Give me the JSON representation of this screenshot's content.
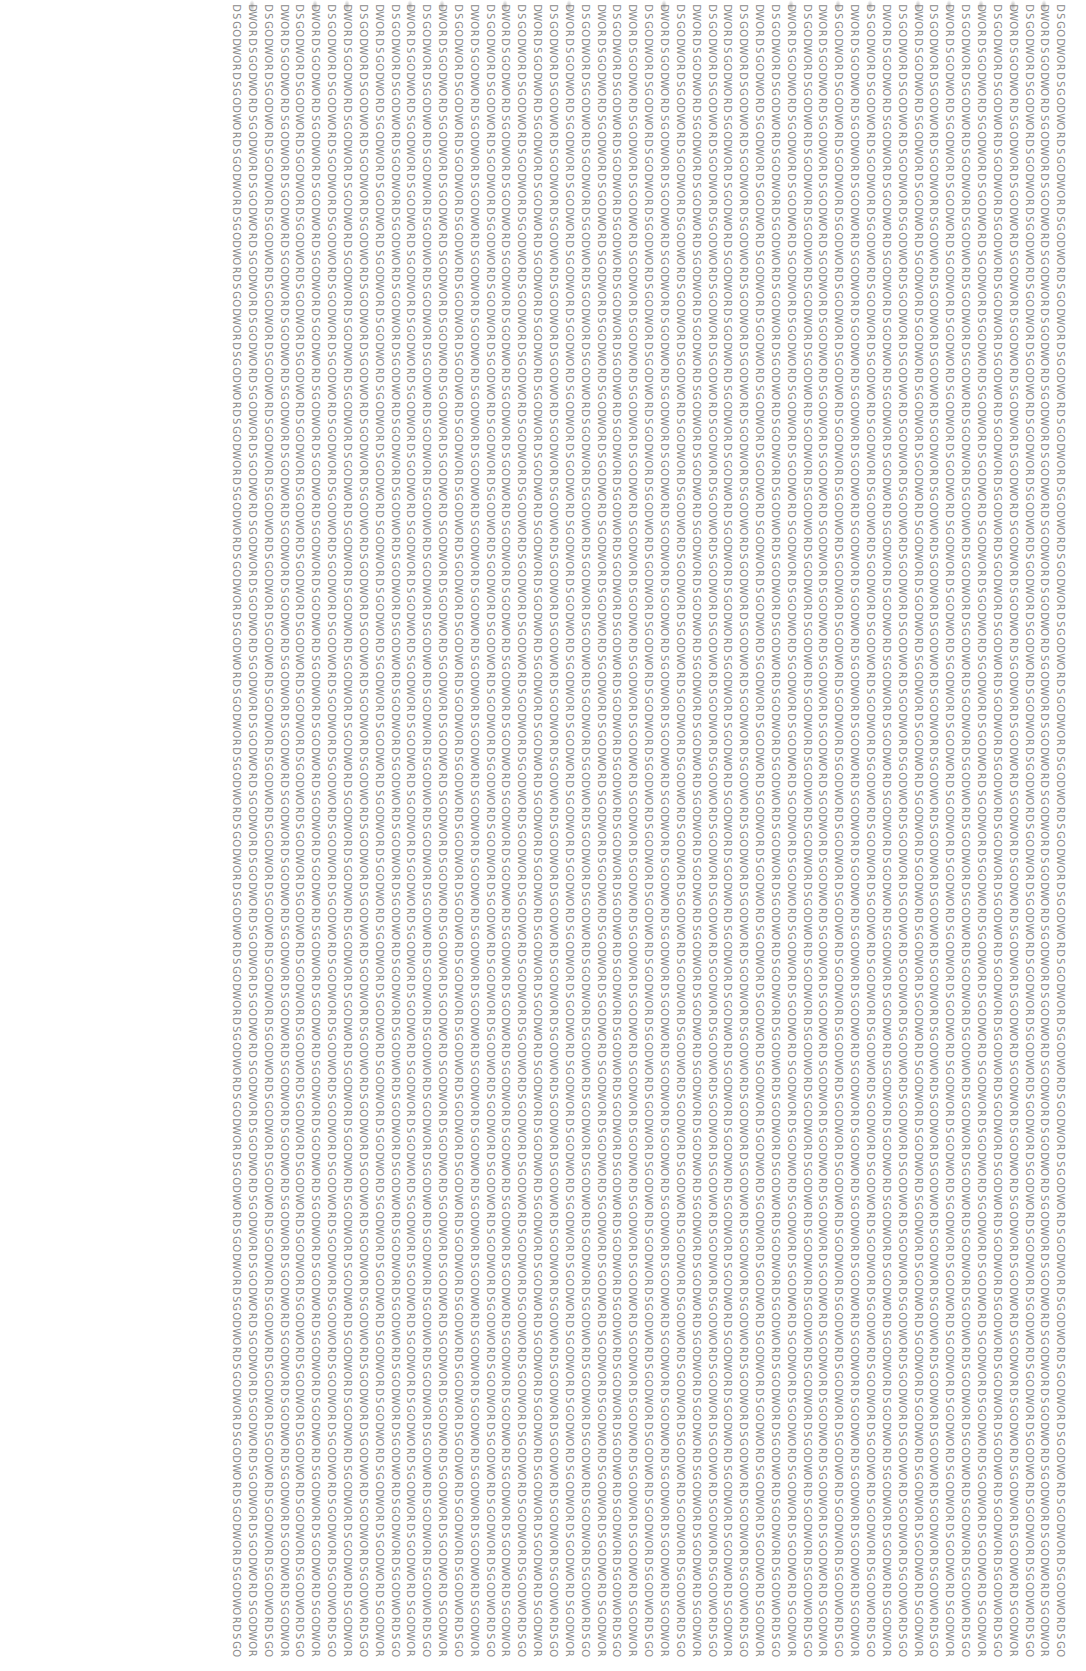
{
  "pattern": {
    "base_word": "WORDSGOD",
    "column_count": 53,
    "chars_per_column": 196,
    "first_column_x": 236,
    "column_pitch": 15.85,
    "char_pitch": 8.45,
    "start_offsets": {
      "even": 3,
      "odd": 7
    },
    "even_column_start": "RDSGODWO",
    "odd_column_start": "DWORDSGO",
    "text_color": "#8a8a8a",
    "background": "#ffffff"
  },
  "smudge_columns": [
    1,
    5,
    7,
    11,
    13,
    17,
    21,
    27,
    35,
    38,
    40,
    43,
    45,
    47,
    49,
    51
  ]
}
